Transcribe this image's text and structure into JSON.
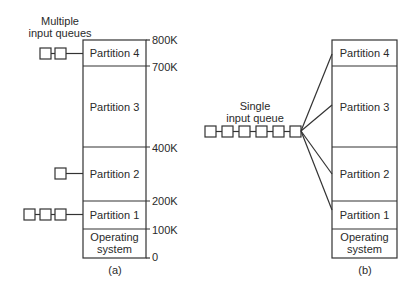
{
  "diagram_a": {
    "caption": "(a)",
    "queue_label_line1": "Multiple",
    "queue_label_line2": "input queues",
    "partitions": [
      {
        "label": "Partition 4",
        "queue_length": 2
      },
      {
        "label": "Partition 3",
        "queue_length": 0
      },
      {
        "label": "Partition 2",
        "queue_length": 1
      },
      {
        "label": "Partition 1",
        "queue_length": 3
      }
    ],
    "os_line1": "Operating",
    "os_line2": "system",
    "addresses": [
      "800K",
      "700K",
      "400K",
      "200K",
      "100K",
      "0"
    ]
  },
  "diagram_b": {
    "caption": "(b)",
    "queue_label_line1": "Single",
    "queue_label_line2": "input queue",
    "queue_length": 6,
    "partitions": [
      {
        "label": "Partition 4"
      },
      {
        "label": "Partition 3"
      },
      {
        "label": "Partition 2"
      },
      {
        "label": "Partition 1"
      }
    ],
    "os_line1": "Operating",
    "os_line2": "system"
  },
  "colors": {
    "stroke": "#333333",
    "text": "#2a2a2a",
    "background": "#ffffff"
  }
}
